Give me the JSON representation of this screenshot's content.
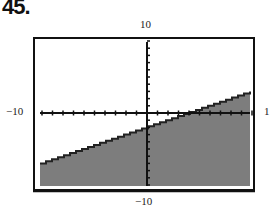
{
  "problem_number": "45.",
  "axis_labels": {
    "y_max": "10",
    "y_min": "−10",
    "x_min": "−10",
    "x_max": "1"
  },
  "colors": {
    "shade": "#7d7d7d",
    "border": "#111111",
    "axis": "#111111",
    "background": "#ffffff"
  },
  "chart_data": {
    "type": "area",
    "title": "",
    "xlabel": "",
    "ylabel": "",
    "xlim": [
      -10,
      10
    ],
    "ylim": [
      -10,
      10
    ],
    "tick_labels": {
      "x_left": "-10",
      "x_right": "1",
      "y_top": "10",
      "y_bottom": "-10"
    },
    "boundary_line": {
      "x": [
        -10,
        10
      ],
      "y": [
        -7,
        3
      ],
      "slope": 0.5,
      "intercept": -2
    },
    "shaded_region": "below",
    "grid": false,
    "axes_tick_marks": true
  }
}
